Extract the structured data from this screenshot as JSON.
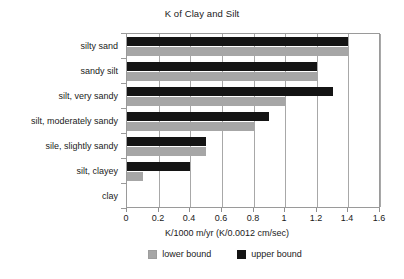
{
  "chart_data": {
    "type": "bar",
    "orientation": "horizontal",
    "title": "K of Clay and Silt",
    "xlabel": "K/1000 m/yr (K/0.0012 cm/sec)",
    "ylabel": "",
    "xlim": [
      0,
      1.6
    ],
    "xticks": [
      "0",
      "0.2",
      "0.4",
      "0.6",
      "0.8",
      "1",
      "1.2",
      "1.4",
      "1.6"
    ],
    "xtick_values": [
      0,
      0.2,
      0.4,
      0.6,
      0.8,
      1,
      1.2,
      1.4,
      1.6
    ],
    "grid": "vertical",
    "legend_position": "bottom",
    "categories": [
      "clay",
      "silt, clayey",
      "sile, slightly sandy",
      "silt, moderately sandy",
      "silt, very sandy",
      "sandy silt",
      "silty sand"
    ],
    "series": [
      {
        "name": "lower bound",
        "color": "#a6a6a6",
        "values": [
          0,
          0.1,
          0.5,
          0.8,
          1.0,
          1.2,
          1.4
        ]
      },
      {
        "name": "upper bound",
        "color": "#141414",
        "values": [
          0,
          0.4,
          0.5,
          0.9,
          1.3,
          1.2,
          1.4
        ]
      }
    ]
  },
  "legend": {
    "items": [
      {
        "label": "lower bound",
        "swatch": "gray-square-icon"
      },
      {
        "label": "upper bound",
        "swatch": "black-square-icon"
      }
    ]
  }
}
